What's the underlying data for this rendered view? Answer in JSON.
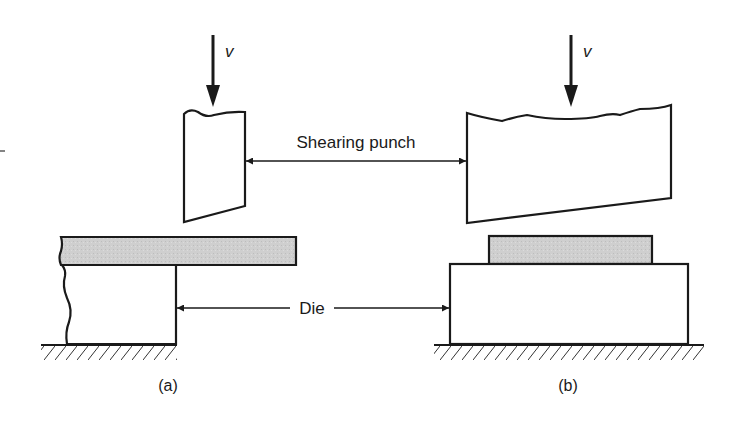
{
  "figure": {
    "labels": {
      "shearing_punch": "Shearing punch",
      "die": "Die",
      "velocity_left": "v",
      "velocity_right": "v",
      "caption_a": "(a)",
      "caption_b": "(b)"
    },
    "colors": {
      "stroke": "#1a1a1a",
      "workpiece_fill": "#cfcfcf",
      "background": "#ffffff"
    }
  }
}
